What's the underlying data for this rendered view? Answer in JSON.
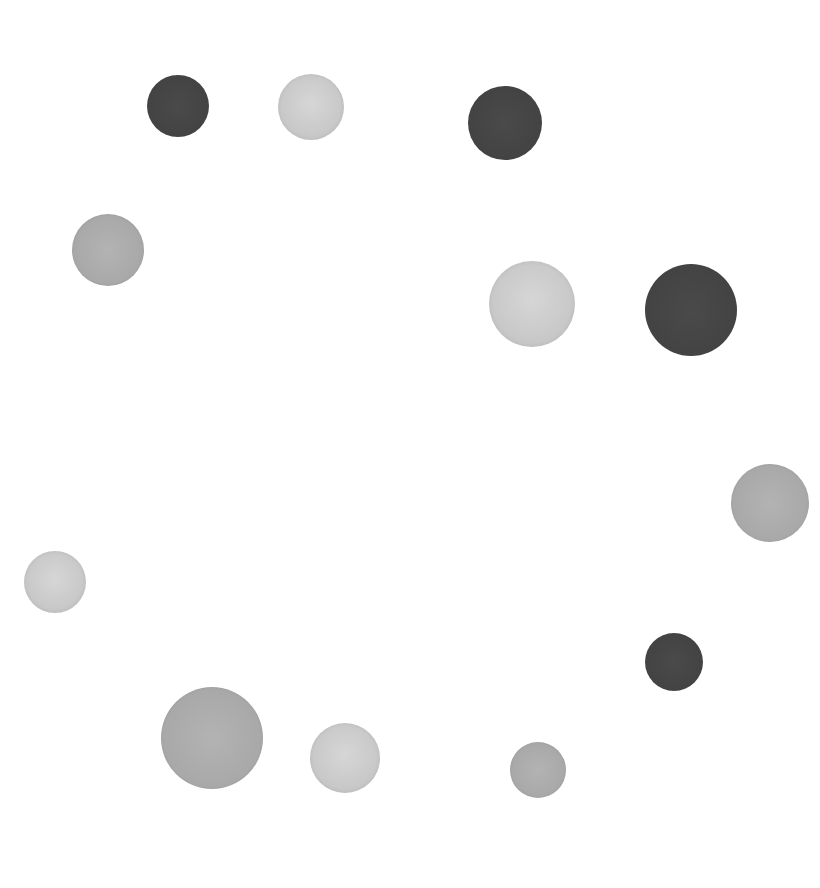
{
  "image": {
    "width": 820,
    "height": 888,
    "background": "#ffffff",
    "description": "Twelve hand-painted gray circles scattered roughly in a ring on a white background"
  },
  "palette": {
    "dark": "#444444",
    "mid": "#a9a9a9",
    "light": "#c8c8c8"
  },
  "dots": [
    {
      "id": "dot-1",
      "tone": "dark",
      "cx": 178,
      "cy": 106,
      "d": 62
    },
    {
      "id": "dot-2",
      "tone": "light",
      "cx": 311,
      "cy": 107,
      "d": 66
    },
    {
      "id": "dot-3",
      "tone": "dark",
      "cx": 505,
      "cy": 123,
      "d": 74
    },
    {
      "id": "dot-4",
      "tone": "mid",
      "cx": 108,
      "cy": 250,
      "d": 72
    },
    {
      "id": "dot-5",
      "tone": "light",
      "cx": 532,
      "cy": 304,
      "d": 86
    },
    {
      "id": "dot-6",
      "tone": "dark",
      "cx": 691,
      "cy": 310,
      "d": 92
    },
    {
      "id": "dot-7",
      "tone": "mid",
      "cx": 770,
      "cy": 503,
      "d": 78
    },
    {
      "id": "dot-8",
      "tone": "light",
      "cx": 55,
      "cy": 582,
      "d": 62
    },
    {
      "id": "dot-9",
      "tone": "dark",
      "cx": 674,
      "cy": 662,
      "d": 58
    },
    {
      "id": "dot-10",
      "tone": "mid",
      "cx": 212,
      "cy": 738,
      "d": 102
    },
    {
      "id": "dot-11",
      "tone": "light",
      "cx": 345,
      "cy": 758,
      "d": 70
    },
    {
      "id": "dot-12",
      "tone": "mid",
      "cx": 538,
      "cy": 770,
      "d": 56
    }
  ]
}
